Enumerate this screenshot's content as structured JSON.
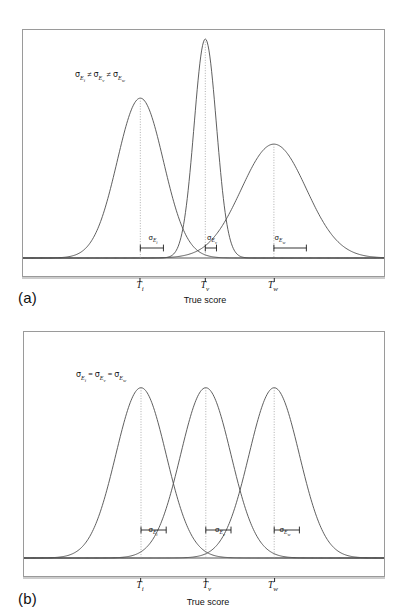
{
  "figure": {
    "panels": [
      {
        "id": "a",
        "letter_label": "(a)",
        "xlabel": "True score",
        "annotation": {
          "text": "σEᵢ ≠ σEᵥ ≠ σEᵥᵥ",
          "sigma": "σ",
          "base": "E",
          "sub_1": "i",
          "sub_2": "v",
          "sub_3": "w",
          "relation": "≠"
        },
        "ticks": [
          {
            "base": "T",
            "sub": "i"
          },
          {
            "base": "T",
            "sub": "v"
          },
          {
            "base": "T",
            "sub": "w"
          }
        ],
        "sigma_bars": [
          {
            "sigma": "σ",
            "base": "E",
            "sub": "i"
          },
          {
            "sigma": "σ",
            "base": "E",
            "sub": "v"
          },
          {
            "sigma": "σ",
            "base": "E",
            "sub": "w"
          }
        ]
      },
      {
        "id": "b",
        "letter_label": "(b)",
        "xlabel": "True score",
        "annotation": {
          "text": "σEᵢ = σEᵥ = σEᵥᵥ",
          "sigma": "σ",
          "base": "E",
          "sub_1": "i",
          "sub_2": "v",
          "sub_3": "w",
          "relation": "="
        },
        "ticks": [
          {
            "base": "T",
            "sub": "i"
          },
          {
            "base": "T",
            "sub": "v"
          },
          {
            "base": "T",
            "sub": "w"
          }
        ],
        "sigma_bars": [
          {
            "sigma": "σ",
            "base": "E",
            "sub": "i"
          },
          {
            "sigma": "σ",
            "base": "E",
            "sub": "v"
          },
          {
            "sigma": "σ",
            "base": "E",
            "sub": "w"
          }
        ]
      }
    ]
  },
  "chart_data": [
    {
      "type": "line",
      "title": "(a)",
      "xlabel": "True score",
      "ylabel": "",
      "grid": false,
      "legend": false,
      "description": "Three normal (Gaussian) error distributions centered on true scores Ti, Tv, Tw with unequal standard errors of measurement.",
      "xlim": [
        0,
        100
      ],
      "ylim": [
        0,
        1.05
      ],
      "axis_tick_labels": [
        "Ti",
        "Tv",
        "Tw"
      ],
      "axis_tick_positions": [
        32.5,
        50.5,
        69.5
      ],
      "series": [
        {
          "name": "Ti",
          "mean": 32.5,
          "sigma": 6.4,
          "peak_height": 0.73,
          "sigma_bar_length": 6.4
        },
        {
          "name": "Tv",
          "mean": 50.5,
          "sigma": 3.1,
          "peak_height": 1.0,
          "sigma_bar_length": 3.1
        },
        {
          "name": "Tw",
          "mean": 69.5,
          "sigma": 9.0,
          "peak_height": 0.52,
          "sigma_bar_length": 9.0
        }
      ],
      "annotations": [
        "σEi ≠ σEv ≠ σEw",
        "σEi",
        "σEv",
        "σEw"
      ]
    },
    {
      "type": "line",
      "title": "(b)",
      "xlabel": "True score",
      "ylabel": "",
      "grid": false,
      "legend": false,
      "description": "Three normal (Gaussian) error distributions centered on true scores Ti, Tv, Tw with equal standard errors of measurement.",
      "xlim": [
        0,
        100
      ],
      "ylim": [
        0,
        1.05
      ],
      "axis_tick_labels": [
        "Ti",
        "Tv",
        "Tw"
      ],
      "axis_tick_positions": [
        32.5,
        50.5,
        69.5
      ],
      "series": [
        {
          "name": "Ti",
          "mean": 32.5,
          "sigma": 7.0,
          "peak_height": 0.86,
          "sigma_bar_length": 7.0
        },
        {
          "name": "Tv",
          "mean": 50.5,
          "sigma": 7.0,
          "peak_height": 0.86,
          "sigma_bar_length": 7.0
        },
        {
          "name": "Tw",
          "mean": 69.5,
          "sigma": 7.0,
          "peak_height": 0.86,
          "sigma_bar_length": 7.0
        }
      ],
      "annotations": [
        "σEi = σEv = σEw",
        "σEi",
        "σEv",
        "σEw"
      ]
    }
  ],
  "colors": {
    "curve": "#4d4d4d",
    "frame": "#9a9a9a",
    "baseline": "#555555",
    "dotted": "#9a9a9a",
    "text": "#111111",
    "background": "#ffffff"
  }
}
